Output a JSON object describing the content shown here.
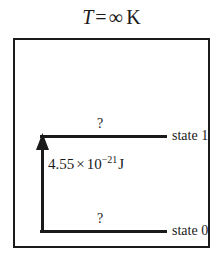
{
  "figure": {
    "title": {
      "variable": "T",
      "equals": "=",
      "value": "∞",
      "unit": "K",
      "full_text": "T = ∞ K"
    },
    "frame": {
      "border_color": "#1a1a1a",
      "background": "#ffffff"
    },
    "levels": [
      {
        "id": "state-1",
        "label": "state 1",
        "population": "?",
        "position": "upper"
      },
      {
        "id": "state-0",
        "label": "state 0",
        "population": "?",
        "position": "lower"
      }
    ],
    "energy_gap": {
      "mantissa": "4.55",
      "times": "×",
      "base": "10",
      "exponent": "−21",
      "unit": "J",
      "full_text": "4.55 × 10−21 J",
      "arrow_direction": "up",
      "color": "#1a1a1a"
    }
  }
}
